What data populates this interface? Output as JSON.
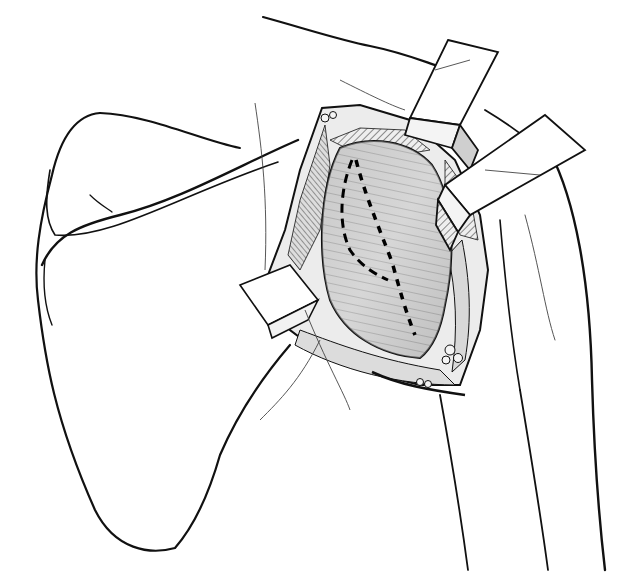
{
  "illustration": {
    "subject": "surgical-exposure-shoulder-posterior",
    "width": 630,
    "height": 582,
    "colors": {
      "background": "#ffffff",
      "ink": "#111111",
      "shade_light": "#e6e6e6",
      "shade_mid": "#c8c8c8",
      "shade_dark": "#9a9a9a"
    },
    "elements": [
      "scapula-outline",
      "scapular-spine",
      "humerus-outline",
      "upper-retractor",
      "right-retractor",
      "left-retractor",
      "exposed-muscle",
      "dashed-incision-lines"
    ]
  }
}
